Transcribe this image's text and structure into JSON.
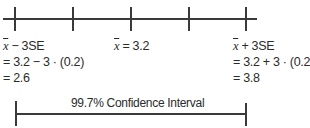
{
  "axis": {
    "ticks": [
      {
        "label": "x̄ − 3SE",
        "value": "2.6"
      },
      {
        "label": "",
        "value": ""
      },
      {
        "label": "x̄ = 3.2",
        "value": "3.2"
      },
      {
        "label": "",
        "value": ""
      },
      {
        "label": "x̄ + 3SE",
        "value": "3.8"
      }
    ]
  },
  "left": {
    "symbol": "x",
    "line1_rest": " − 3SE",
    "line2": "= 3.2 − 3 · (0.2)",
    "line3": "= 2.6"
  },
  "middle": {
    "symbol": "x",
    "line1_rest": " = 3.2"
  },
  "right": {
    "symbol": "x",
    "line1_rest": " + 3SE",
    "line2": "= 3.2 + 3 · (0.2)",
    "line3": "= 3.8"
  },
  "interval": {
    "label": "99.7% Confidence Interval"
  }
}
